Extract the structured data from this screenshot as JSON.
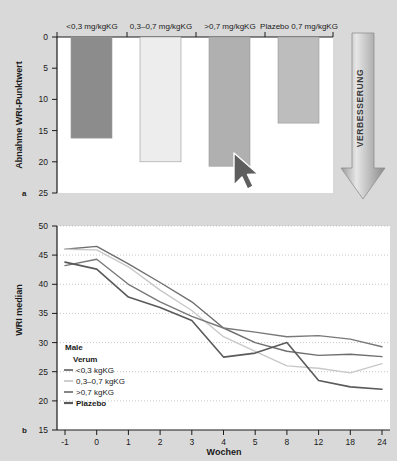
{
  "figure": {
    "background_color": "#d9d9d9",
    "panels": [
      {
        "letter": "a",
        "name": "bar-panel"
      },
      {
        "letter": "b",
        "name": "line-panel"
      }
    ],
    "annotation": {
      "arrow_label": "VERBESSERUNG",
      "arrow_direction": "down",
      "cursor": "mouse-pointer"
    }
  },
  "chart_data": [
    {
      "type": "bar",
      "panel": "a",
      "title": "",
      "xlabel": "",
      "ylabel": "Abnahme WRI-Punktwert",
      "ylim": [
        0,
        25
      ],
      "y_inverted": true,
      "yticks": [
        "0",
        "5",
        "10",
        "15",
        "20",
        "25"
      ],
      "grid": false,
      "categories": [
        "<0,3 mg/kgKG",
        "0,3–0,7 mg/kgKG",
        ">0,7 mg/kgKG",
        "Plazebo 0,7 mg/kgKG"
      ],
      "values": [
        16.2,
        20.0,
        20.7,
        13.8
      ],
      "bar_colors": [
        "#8c8c8c",
        "#ededed",
        "#b0b0b0",
        "#bdbdbd"
      ],
      "plot_background": "#ffffff"
    },
    {
      "type": "line",
      "panel": "b",
      "title": "",
      "xlabel": "Wochen",
      "ylabel": "WRI median",
      "ylim": [
        15,
        50
      ],
      "yticks": [
        "50",
        "45",
        "40",
        "35",
        "30",
        "25",
        "20",
        "15"
      ],
      "xticks": [
        "-1",
        "0",
        "1",
        "2",
        "3",
        "4",
        "5",
        "8",
        "12",
        "18",
        "24"
      ],
      "grid": true,
      "grid_style": "dotted",
      "legend_position": "lower-left",
      "legend_title": "Male",
      "legend_subtitle": "Verum",
      "series": [
        {
          "name": "<0,3 kgKG",
          "color": "#6e6e6e",
          "values": [
            46.0,
            46.5,
            43.5,
            40.3,
            37.0,
            32.5,
            30.0,
            28.5,
            27.8,
            28.0,
            27.6
          ]
        },
        {
          "name": "0,3–0,7 kgKG",
          "color": "#c8c8c8",
          "values": [
            46.0,
            45.9,
            43.0,
            39.0,
            35.5,
            31.0,
            28.5,
            26.0,
            25.6,
            24.8,
            26.4
          ]
        },
        {
          "name": ">0,7 kgKG",
          "color": "#787878",
          "values": [
            43.2,
            44.3,
            40.0,
            37.0,
            34.5,
            32.5,
            31.8,
            31.0,
            31.2,
            30.6,
            29.3
          ]
        },
        {
          "name": "Plazebo",
          "color": "#5a5a5a",
          "values": [
            43.8,
            42.6,
            37.8,
            36.0,
            33.8,
            27.5,
            28.2,
            30.0,
            23.5,
            22.4,
            22.0
          ]
        }
      ],
      "plot_background": "#ffffff"
    }
  ]
}
